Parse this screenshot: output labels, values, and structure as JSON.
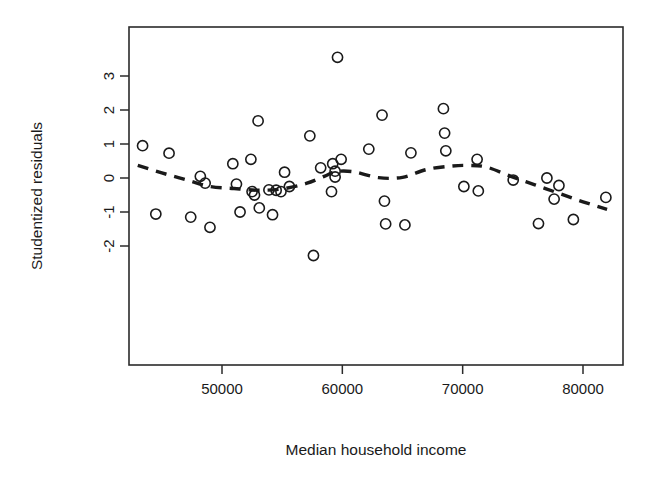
{
  "chart_data": {
    "type": "scatter",
    "title": "",
    "xlabel": "Median household income",
    "ylabel": "Studentized residuals",
    "xlim": [
      42700,
      83000
    ],
    "ylim": [
      -2.45,
      3.8
    ],
    "xticks": [
      50000,
      60000,
      70000,
      80000
    ],
    "xtick_labels": [
      "50000",
      "60000",
      "70000",
      "80000"
    ],
    "yticks": [
      -2,
      -1,
      0,
      1,
      2,
      3
    ],
    "ytick_labels": [
      "-2",
      "-1",
      "0",
      "1",
      "2",
      "3"
    ],
    "grid": false,
    "legend": false,
    "marker": "open-circle",
    "points": [
      {
        "x": 43400,
        "y": 0.95
      },
      {
        "x": 44500,
        "y": -1.06
      },
      {
        "x": 45600,
        "y": 0.73
      },
      {
        "x": 47400,
        "y": -1.15
      },
      {
        "x": 48200,
        "y": 0.05
      },
      {
        "x": 48600,
        "y": -0.15
      },
      {
        "x": 49000,
        "y": -1.45
      },
      {
        "x": 50900,
        "y": 0.42
      },
      {
        "x": 51200,
        "y": -0.18
      },
      {
        "x": 51500,
        "y": -1.0
      },
      {
        "x": 52400,
        "y": 0.55
      },
      {
        "x": 52500,
        "y": -0.4
      },
      {
        "x": 52700,
        "y": -0.5
      },
      {
        "x": 53000,
        "y": 1.68
      },
      {
        "x": 53100,
        "y": -0.88
      },
      {
        "x": 53900,
        "y": -0.35
      },
      {
        "x": 54200,
        "y": -1.08
      },
      {
        "x": 54500,
        "y": -0.36
      },
      {
        "x": 54900,
        "y": -0.4
      },
      {
        "x": 55200,
        "y": 0.17
      },
      {
        "x": 55600,
        "y": -0.25
      },
      {
        "x": 57300,
        "y": 1.24
      },
      {
        "x": 57600,
        "y": -2.28
      },
      {
        "x": 58200,
        "y": 0.3
      },
      {
        "x": 59100,
        "y": -0.4
      },
      {
        "x": 59200,
        "y": 0.42
      },
      {
        "x": 59400,
        "y": 0.2
      },
      {
        "x": 59400,
        "y": 0.03
      },
      {
        "x": 59600,
        "y": 3.55
      },
      {
        "x": 59900,
        "y": 0.55
      },
      {
        "x": 62200,
        "y": 0.85
      },
      {
        "x": 63300,
        "y": 1.85
      },
      {
        "x": 63500,
        "y": -0.68
      },
      {
        "x": 63600,
        "y": -1.35
      },
      {
        "x": 65200,
        "y": -1.38
      },
      {
        "x": 65700,
        "y": 0.74
      },
      {
        "x": 68400,
        "y": 2.04
      },
      {
        "x": 68500,
        "y": 1.32
      },
      {
        "x": 68600,
        "y": 0.8
      },
      {
        "x": 70100,
        "y": -0.25
      },
      {
        "x": 71200,
        "y": 0.55
      },
      {
        "x": 71300,
        "y": -0.38
      },
      {
        "x": 74200,
        "y": -0.06
      },
      {
        "x": 76300,
        "y": -1.34
      },
      {
        "x": 77000,
        "y": 0.0
      },
      {
        "x": 77600,
        "y": -0.62
      },
      {
        "x": 78000,
        "y": -0.22
      },
      {
        "x": 79200,
        "y": -1.22
      },
      {
        "x": 81900,
        "y": -0.57
      }
    ],
    "smooth_curve": {
      "style": "dashed",
      "label": "lowess smoother",
      "x": [
        43000,
        45000,
        47000,
        49000,
        51000,
        53000,
        55000,
        57000,
        58500,
        59500,
        61000,
        63000,
        65000,
        67000,
        69000,
        70500,
        72000,
        74000,
        76000,
        78000,
        80000,
        82000
      ],
      "y": [
        0.37,
        0.15,
        -0.05,
        -0.25,
        -0.31,
        -0.36,
        -0.32,
        -0.16,
        0.05,
        0.19,
        0.18,
        0.01,
        0.02,
        0.25,
        0.35,
        0.37,
        0.32,
        0.05,
        -0.2,
        -0.45,
        -0.7,
        -0.92
      ]
    }
  }
}
